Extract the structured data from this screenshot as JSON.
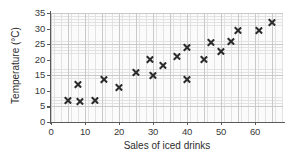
{
  "chart_data": {
    "type": "scatter",
    "title": "",
    "xlabel": "Sales of iced drinks",
    "ylabel": "Temperature (°C)",
    "xlim": [
      0,
      68
    ],
    "ylim": [
      0,
      35
    ],
    "xticks": [
      0,
      10,
      20,
      30,
      40,
      50,
      60
    ],
    "yticks": [
      0,
      5,
      10,
      15,
      20,
      25,
      30,
      35
    ],
    "grid": true,
    "legend": null,
    "marker": "x",
    "marker_color": "#2b2b2b",
    "points": [
      {
        "x": 5,
        "y": 7
      },
      {
        "x": 8,
        "y": 12
      },
      {
        "x": 8.5,
        "y": 6.5
      },
      {
        "x": 13,
        "y": 7
      },
      {
        "x": 15.5,
        "y": 13.5
      },
      {
        "x": 20,
        "y": 11
      },
      {
        "x": 25,
        "y": 16
      },
      {
        "x": 29,
        "y": 20
      },
      {
        "x": 30,
        "y": 15
      },
      {
        "x": 33,
        "y": 18
      },
      {
        "x": 37,
        "y": 21
      },
      {
        "x": 40,
        "y": 13.5
      },
      {
        "x": 40,
        "y": 24
      },
      {
        "x": 45,
        "y": 20
      },
      {
        "x": 47,
        "y": 25.5
      },
      {
        "x": 50,
        "y": 22.5
      },
      {
        "x": 53,
        "y": 26
      },
      {
        "x": 55,
        "y": 29.5
      },
      {
        "x": 61,
        "y": 29.5
      },
      {
        "x": 65,
        "y": 32
      }
    ]
  }
}
